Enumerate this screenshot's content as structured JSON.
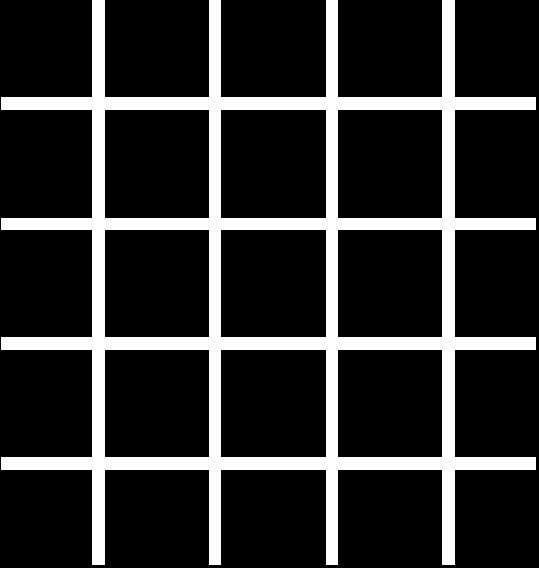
{
  "figure": {
    "type": "hermann-grid-illusion",
    "width": 539,
    "height": 568,
    "background_color": "#000000",
    "line_color": "#ffffff",
    "rows": 5,
    "columns": 5,
    "vertical_lines": [
      {
        "x": 92,
        "width": 13,
        "top": 0,
        "bottom": 565
      },
      {
        "x": 209,
        "width": 12,
        "top": 0,
        "bottom": 565
      },
      {
        "x": 326,
        "width": 12,
        "top": 0,
        "bottom": 565
      },
      {
        "x": 442,
        "width": 13,
        "top": 0,
        "bottom": 565
      }
    ],
    "horizontal_lines": [
      {
        "y": 97,
        "height": 13,
        "left": 1,
        "right": 536
      },
      {
        "y": 218,
        "height": 12,
        "left": 1,
        "right": 536
      },
      {
        "y": 337,
        "height": 13,
        "left": 1,
        "right": 536
      },
      {
        "y": 457,
        "height": 13,
        "left": 1,
        "right": 536
      }
    ]
  }
}
